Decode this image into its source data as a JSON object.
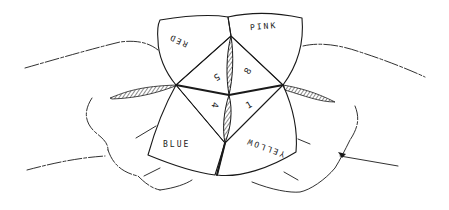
{
  "illustration": {
    "subject": "Hands holding a paper fortune teller",
    "outer_flaps": {
      "top_left": "RED",
      "top_right": "PINK",
      "bottom_left": "BLUE",
      "bottom_right": "YELLOW"
    },
    "inner_numbers": {
      "top_left": "5",
      "top_right": "8",
      "bottom_left": "4",
      "bottom_right": "1"
    },
    "colors": {
      "ink": "#1a1a1a",
      "paper": "#ffffff"
    }
  }
}
